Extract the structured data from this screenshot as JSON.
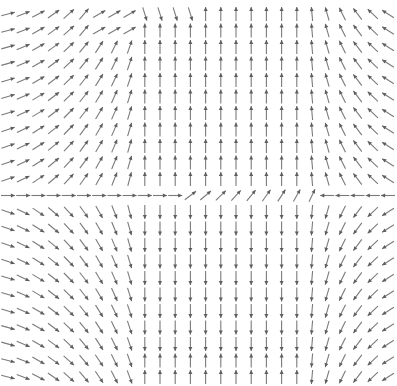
{
  "chart_data": {
    "type": "quiver",
    "title": "",
    "xlabel": "",
    "ylabel": "",
    "grid": false,
    "axes_visible": false,
    "legend": null,
    "arrow_color": "#7a7a7a",
    "background": "#ffffff",
    "grid_layout": {
      "cols": 26,
      "rows": 23,
      "x_start": 8,
      "x_step": 15.2,
      "y_start": 14,
      "y_step": 16.5,
      "arrow_length": 14,
      "separator_row": 11
    },
    "regions": [
      {
        "name": "upper-left",
        "rows": [
          0,
          10
        ],
        "cols": [
          0,
          8
        ],
        "flow": "right turning up (counter-clockwise toward north-east)"
      },
      {
        "name": "upper-center",
        "rows": [
          0,
          10
        ],
        "cols": [
          9,
          20
        ],
        "flow": "up (north)"
      },
      {
        "name": "upper-right",
        "rows": [
          0,
          10
        ],
        "cols": [
          21,
          25
        ],
        "flow": "up-left (north-west)"
      },
      {
        "name": "separator",
        "rows": [
          11,
          11
        ],
        "cols": [
          0,
          25
        ],
        "flow": "right on left, up-right in middle, left on right"
      },
      {
        "name": "lower-left",
        "rows": [
          12,
          22
        ],
        "cols": [
          0,
          8
        ],
        "flow": "right turning down (south-east)"
      },
      {
        "name": "lower-center",
        "rows": [
          12,
          22
        ],
        "cols": [
          9,
          20
        ],
        "flow": "down (south), reversing to up near bottom"
      },
      {
        "name": "lower-right",
        "rows": [
          12,
          22
        ],
        "cols": [
          21,
          25
        ],
        "flow": "down-left (south-west)"
      }
    ]
  }
}
